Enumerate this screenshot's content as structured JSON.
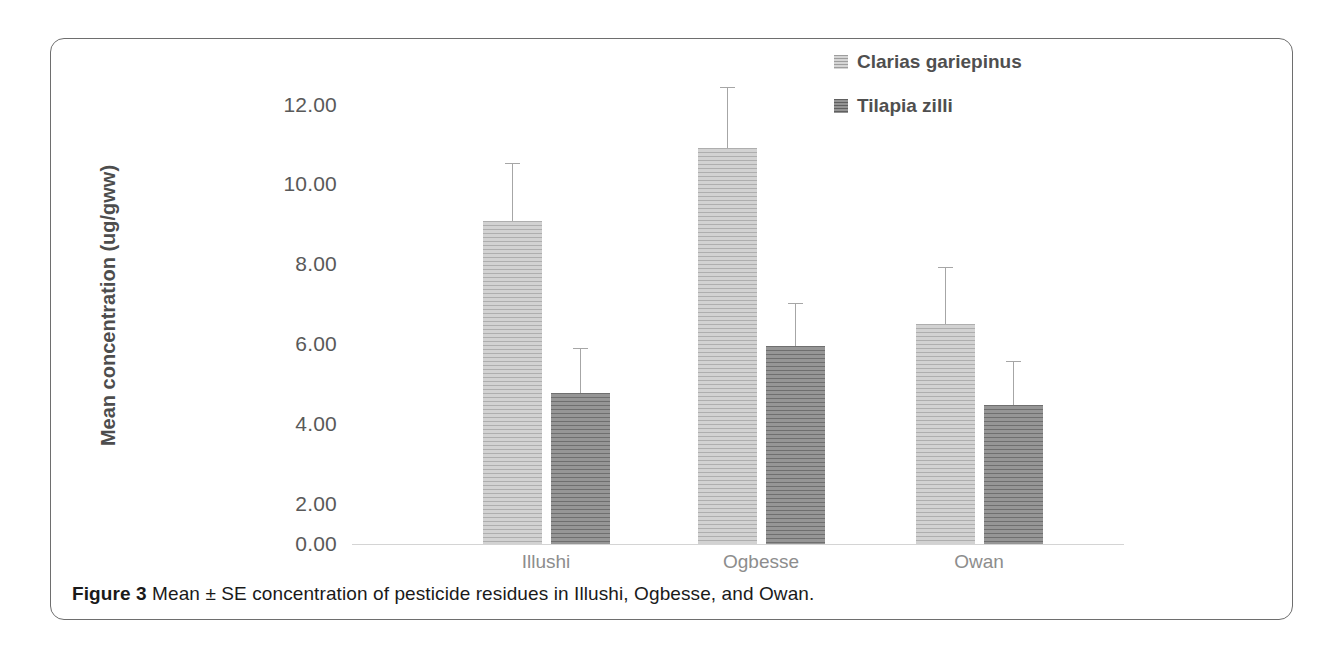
{
  "figure": {
    "caption_label": "Figure 3",
    "caption_text": "Mean ± SE concentration of pesticide residues in Illushi, Ogbesse, and Owan."
  },
  "legend": {
    "position": "top-right",
    "items": [
      {
        "label": "Clarias gariepinus",
        "swatch": "light-hatched-square",
        "color": "#c0c0c0"
      },
      {
        "label": "Tilapia zilli",
        "swatch": "dark-hatched-square",
        "color": "#8a8a8a"
      }
    ]
  },
  "chart_data": {
    "type": "bar",
    "title": "",
    "xlabel": "",
    "ylabel": "Mean concentration (ug/gww)",
    "categories": [
      "Illushi",
      "Ogbesse",
      "Owan"
    ],
    "ylim": [
      0,
      12
    ],
    "ytick_labels": [
      "12.00",
      "10.00",
      "8.00",
      "6.00",
      "4.00",
      "2.00",
      "0.00"
    ],
    "ytick_values": [
      12,
      10,
      8,
      6,
      4,
      2,
      0
    ],
    "grid": false,
    "error_bars": "SE (upper only)",
    "series": [
      {
        "name": "Clarias gariepinus",
        "color": "#c0c0c0",
        "values": [
          8.12,
          9.95,
          5.53
        ],
        "errors": [
          1.43,
          1.51,
          1.41
        ]
      },
      {
        "name": "Tilapia zilli",
        "color": "#8a8a8a",
        "values": [
          3.79,
          4.97,
          3.49
        ],
        "errors": [
          1.11,
          1.06,
          1.08
        ]
      }
    ]
  }
}
